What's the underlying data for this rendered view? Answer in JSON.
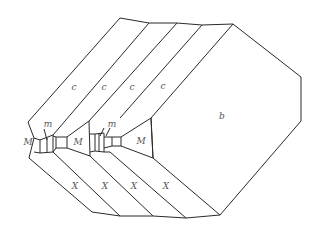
{
  "diagram": {
    "type": "crystal-habit-drawing",
    "stroke_color": "#2a2a2a",
    "label_color": "#555555",
    "faces": [
      {
        "id": "c1",
        "label": "c",
        "x": 74,
        "y": 87
      },
      {
        "id": "c2",
        "label": "c",
        "x": 104,
        "y": 87
      },
      {
        "id": "c3",
        "label": "c",
        "x": 132,
        "y": 87
      },
      {
        "id": "c4",
        "label": "c",
        "x": 163,
        "y": 86
      },
      {
        "id": "b",
        "label": "b",
        "x": 222,
        "y": 116
      },
      {
        "id": "M1",
        "label": "M",
        "x": 28,
        "y": 142
      },
      {
        "id": "M2",
        "label": "M",
        "x": 78,
        "y": 142
      },
      {
        "id": "M3",
        "label": "M",
        "x": 141,
        "y": 141
      },
      {
        "id": "m1",
        "label": "m",
        "x": 48,
        "y": 124
      },
      {
        "id": "m2",
        "label": "m",
        "x": 112,
        "y": 124
      },
      {
        "id": "X1",
        "label": "X",
        "x": 75,
        "y": 186
      },
      {
        "id": "X2",
        "label": "X",
        "x": 105,
        "y": 186
      },
      {
        "id": "X3",
        "label": "X",
        "x": 134,
        "y": 186
      },
      {
        "id": "X4",
        "label": "X",
        "x": 166,
        "y": 186
      }
    ]
  }
}
